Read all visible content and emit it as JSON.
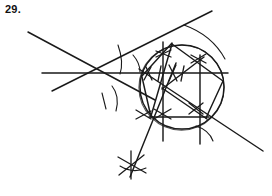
{
  "page": {
    "background_color": "#ffffff",
    "ink_color": "#1a1a1a",
    "width": 272,
    "height": 196
  },
  "label": {
    "problem_number": "29."
  },
  "figure": {
    "kind": "hand-drawn-geometric-construction",
    "circle": {
      "cx": 182,
      "cy": 87,
      "r": 42
    },
    "lines": [
      {
        "name": "horizontal-diameter",
        "x1": 42,
        "y1": 73,
        "x2": 228,
        "y2": 73,
        "weight": "med"
      },
      {
        "name": "diagonal-down-right",
        "x1": 28,
        "y1": 32,
        "x2": 152,
        "y2": 98,
        "weight": "med"
      },
      {
        "name": "diagonal-up-right",
        "x1": 52,
        "y1": 90,
        "x2": 210,
        "y2": 12,
        "weight": "med"
      },
      {
        "name": "secant-to-lower-right",
        "x1": 140,
        "y1": 70,
        "x2": 262,
        "y2": 150,
        "weight": "med"
      },
      {
        "name": "vertical-chord-left",
        "x1": 163,
        "y1": 43,
        "x2": 163,
        "y2": 140,
        "weight": "med"
      },
      {
        "name": "vertical-chord-right",
        "x1": 200,
        "y1": 55,
        "x2": 200,
        "y2": 143,
        "weight": "med"
      },
      {
        "name": "lower-horizontal-chord",
        "x1": 150,
        "y1": 117,
        "x2": 208,
        "y2": 117,
        "weight": "med"
      },
      {
        "name": "ray-to-bottom-star",
        "x1": 175,
        "y1": 64,
        "x2": 131,
        "y2": 176,
        "weight": "med"
      }
    ],
    "polygon_chords": [
      {
        "name": "chord-apex-to-left",
        "x1": 172,
        "y1": 43,
        "x2": 143,
        "y2": 76
      },
      {
        "name": "chord-apex-to-lower-left",
        "x1": 172,
        "y1": 44,
        "x2": 152,
        "y2": 116
      },
      {
        "name": "chord-apex-to-right",
        "x1": 172,
        "y1": 44,
        "x2": 222,
        "y2": 81
      },
      {
        "name": "chord-left-to-lowerleft",
        "x1": 143,
        "y1": 77,
        "x2": 152,
        "y2": 117
      },
      {
        "name": "chord-right-to-lowerright",
        "x1": 222,
        "y1": 81,
        "x2": 206,
        "y2": 118
      },
      {
        "name": "chord-lowerleft-to-lowerright",
        "x1": 152,
        "y1": 117,
        "x2": 206,
        "y2": 118
      },
      {
        "name": "chord-center-to-upperright",
        "x1": 163,
        "y1": 88,
        "x2": 203,
        "y2": 58
      },
      {
        "name": "chord-center-to-lowerright",
        "x1": 163,
        "y1": 88,
        "x2": 206,
        "y2": 118
      }
    ],
    "arcs": [
      {
        "name": "arc-left-outer-upper",
        "d": "M 118 45 Q 124 62 120 74"
      },
      {
        "name": "arc-left-outer-lower",
        "d": "M 111 86 Q 119 96 115 110"
      },
      {
        "name": "arc-left-short",
        "d": "M 102 94 Q 104 101 105 108"
      },
      {
        "name": "arc-lower-right-small",
        "d": "M 196 126 Q 208 130 212 140"
      },
      {
        "name": "arc-bottom-star",
        "d": "M 121 167 Q 133 173 145 169"
      },
      {
        "name": "arc-top-right-sweep",
        "d": "M 186 26 Q 212 36 224 58"
      }
    ],
    "tick_marks": [
      {
        "name": "tick-h-left-1",
        "x1": 146,
        "y1": 68,
        "x2": 152,
        "y2": 79
      },
      {
        "name": "tick-h-left-2",
        "x1": 150,
        "y1": 68,
        "x2": 144,
        "y2": 79
      },
      {
        "name": "tick-h-mid",
        "x1": 161,
        "y1": 67,
        "x2": 159,
        "y2": 80
      },
      {
        "name": "tick-h-center-1",
        "x1": 175,
        "y1": 66,
        "x2": 170,
        "y2": 80
      },
      {
        "name": "tick-h-center-2",
        "x1": 170,
        "y1": 66,
        "x2": 176,
        "y2": 80
      },
      {
        "name": "tick-h-right",
        "x1": 183,
        "y1": 67,
        "x2": 181,
        "y2": 80
      },
      {
        "name": "tick-upper-v-1",
        "x1": 157,
        "y1": 52,
        "x2": 170,
        "y2": 56
      },
      {
        "name": "tick-upper-v-2",
        "x1": 157,
        "y1": 57,
        "x2": 170,
        "y2": 51
      },
      {
        "name": "tick-upper-right-1",
        "x1": 192,
        "y1": 56,
        "x2": 205,
        "y2": 62
      },
      {
        "name": "tick-upper-right-2",
        "x1": 192,
        "y1": 62,
        "x2": 205,
        "y2": 55
      },
      {
        "name": "tick-lower-mid-1",
        "x1": 155,
        "y1": 110,
        "x2": 170,
        "y2": 118
      },
      {
        "name": "tick-lower-mid-2",
        "x1": 155,
        "y1": 118,
        "x2": 170,
        "y2": 110
      },
      {
        "name": "tick-lower-right-1",
        "x1": 190,
        "y1": 104,
        "x2": 202,
        "y2": 113
      },
      {
        "name": "tick-lower-right-2",
        "x1": 190,
        "y1": 113,
        "x2": 202,
        "y2": 104
      },
      {
        "name": "tick-left-node-1",
        "x1": 137,
        "y1": 110,
        "x2": 150,
        "y2": 118
      },
      {
        "name": "tick-left-node-2",
        "x1": 137,
        "y1": 118,
        "x2": 150,
        "y2": 111
      },
      {
        "name": "tick-star-bottom-1",
        "x1": 119,
        "y1": 158,
        "x2": 145,
        "y2": 172
      },
      {
        "name": "tick-star-bottom-2",
        "x1": 120,
        "y1": 174,
        "x2": 143,
        "y2": 156
      },
      {
        "name": "tick-star-bottom-3",
        "x1": 131,
        "y1": 152,
        "x2": 131,
        "y2": 178
      }
    ]
  }
}
